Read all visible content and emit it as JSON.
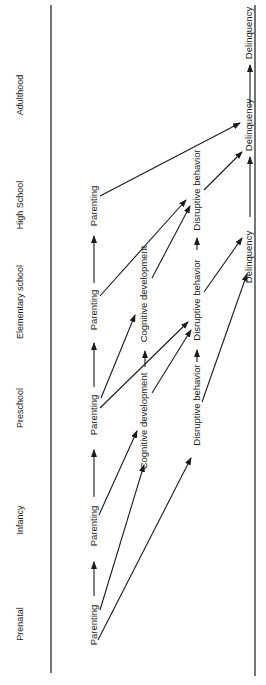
{
  "stages": [
    {
      "id": "prenatal",
      "label": "Prenatal"
    },
    {
      "id": "infancy",
      "label": "Infancy"
    },
    {
      "id": "preschool",
      "label": "Preschool"
    },
    {
      "id": "elementary",
      "label": "Elementary school"
    },
    {
      "id": "highschool",
      "label": "High School"
    },
    {
      "id": "adulthood",
      "label": "Adulthood"
    }
  ],
  "nodes": {
    "parenting_prenatal": "Parenting",
    "parenting_infancy": "Parenting",
    "parenting_preschool": "Parenting",
    "parenting_elementary": "Parenting",
    "parenting_highschool": "Parenting",
    "cognitive_preschool": "Cognitive development",
    "cognitive_elementary": "Cognitive development",
    "disruptive_preschool": "Disruptive behavior",
    "disruptive_elementary": "Disruptive behavior",
    "disruptive_highschool": "Disruptive behavior",
    "delinquency_elementary": "Delinquency",
    "delinquency_highschool": "Delinquency",
    "delinquency_adulthood": "Delinquency"
  },
  "edges": [
    {
      "from": "parenting_prenatal",
      "to": "parenting_infancy"
    },
    {
      "from": "parenting_prenatal",
      "to": "cognitive_preschool"
    },
    {
      "from": "parenting_prenatal",
      "to": "disruptive_preschool"
    },
    {
      "from": "parenting_infancy",
      "to": "parenting_preschool"
    },
    {
      "from": "parenting_infancy",
      "to": "cognitive_preschool"
    },
    {
      "from": "parenting_preschool",
      "to": "parenting_elementary"
    },
    {
      "from": "parenting_preschool",
      "to": "cognitive_elementary"
    },
    {
      "from": "parenting_preschool",
      "to": "disruptive_elementary"
    },
    {
      "from": "cognitive_preschool",
      "to": "cognitive_elementary"
    },
    {
      "from": "cognitive_preschool",
      "to": "disruptive_elementary"
    },
    {
      "from": "disruptive_preschool",
      "to": "disruptive_elementary"
    },
    {
      "from": "disruptive_preschool",
      "to": "delinquency_elementary"
    },
    {
      "from": "parenting_elementary",
      "to": "parenting_highschool"
    },
    {
      "from": "parenting_elementary",
      "to": "disruptive_highschool"
    },
    {
      "from": "cognitive_elementary",
      "to": "disruptive_highschool"
    },
    {
      "from": "disruptive_elementary",
      "to": "disruptive_highschool"
    },
    {
      "from": "disruptive_elementary",
      "to": "delinquency_elementary"
    },
    {
      "from": "delinquency_elementary",
      "to": "delinquency_highschool"
    },
    {
      "from": "disruptive_highschool",
      "to": "delinquency_highschool"
    },
    {
      "from": "parenting_highschool",
      "to": "delinquency_adulthood"
    },
    {
      "from": "delinquency_highschool",
      "to": "delinquency_adulthood"
    }
  ]
}
